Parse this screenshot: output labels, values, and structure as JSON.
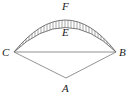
{
  "figure": {
    "type": "geometry-diagram",
    "background_color": "#ffffff",
    "stroke_color": "#555555",
    "hatch_color": "#6b6b6b",
    "label_color": "#1a1a1a",
    "labels": {
      "F": "F",
      "E": "E",
      "C": "C",
      "B": "B",
      "A": "A"
    },
    "points": {
      "C": {
        "x": 14,
        "y": 52
      },
      "B": {
        "x": 116,
        "y": 52
      },
      "A": {
        "x": 66,
        "y": 78
      },
      "arc_outer_apex": {
        "x": 66,
        "y": 13
      },
      "arc_inner_apex": {
        "x": 66,
        "y": 24
      }
    },
    "elements": [
      "outer-arc",
      "inner-arc",
      "hatched-band",
      "chord-cb",
      "segment-left-ca",
      "segment-right-ab"
    ],
    "hatch_line_count": 33
  }
}
